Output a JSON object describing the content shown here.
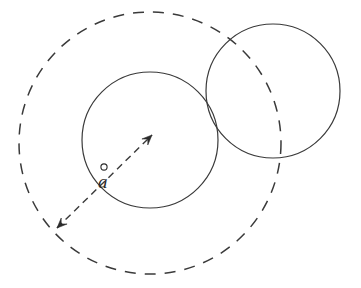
{
  "figure": {
    "background_color": "#ffffff",
    "stroke_color": "#3a3a3a",
    "label_color": "#2b2b2b",
    "canvas": {
      "width": 361,
      "height": 288
    }
  },
  "shapes": {
    "dashed_circle": {
      "name": "outer-dashed-circle",
      "style": "dashed",
      "cx": 150,
      "cy": 143,
      "r": 131,
      "stroke_width": 1.5,
      "dash_pattern": "11 9"
    },
    "center_circle": {
      "name": "center-solid-circle",
      "style": "solid",
      "cx": 150,
      "cy": 140,
      "r": 68,
      "stroke_width": 1.2
    },
    "right_circle": {
      "name": "right-solid-circle",
      "style": "solid",
      "cx": 273,
      "cy": 91,
      "r": 67,
      "stroke_width": 1.2
    }
  },
  "arrow": {
    "name": "double-headed-vector-arrow",
    "style": "dashed",
    "dash_pattern": "7 5",
    "stroke_width": 1.4,
    "start": {
      "x": 57,
      "y": 228
    },
    "end": {
      "x": 152,
      "y": 135
    },
    "head_size": 10
  },
  "labels": {
    "vector_label": {
      "text": "a",
      "accent": "ring",
      "x": 98,
      "y": 188,
      "font_size": 19,
      "italic": true
    }
  }
}
